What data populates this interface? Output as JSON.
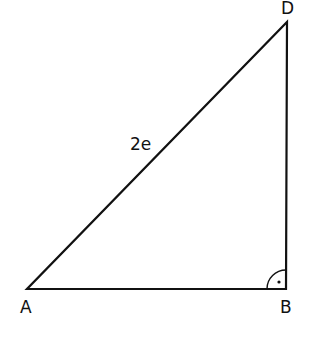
{
  "diagram": {
    "type": "right-triangle",
    "vertices": {
      "A": {
        "label": "A",
        "x": 27,
        "y": 289
      },
      "B": {
        "label": "B",
        "x": 286,
        "y": 289
      },
      "D": {
        "label": "D",
        "x": 287,
        "y": 22
      }
    },
    "edges": [
      {
        "from": "A",
        "to": "B",
        "label": ""
      },
      {
        "from": "B",
        "to": "D",
        "label": ""
      },
      {
        "from": "A",
        "to": "D",
        "label": "2e"
      }
    ],
    "right_angle_at": "B",
    "hypotenuse_label": "2e",
    "stroke_color": "#111111"
  }
}
